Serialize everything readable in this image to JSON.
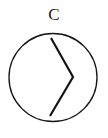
{
  "figure": {
    "label": "C",
    "label_x": 54,
    "label_baseline_y": 20,
    "label_font_size": 17,
    "background_color": "#ffffff",
    "stroke_color": "#171717",
    "label_color": "#1a1a1a",
    "canvas": {
      "width": 108,
      "height": 138
    }
  },
  "circle": {
    "name": "outline-circle",
    "cx": 53,
    "cy": 77.5,
    "r": 44,
    "stroke_width": 1.35,
    "fill": "none",
    "stroke_color": "#171717"
  },
  "chevron": {
    "name": "chevron-right-glyph",
    "points": "51,38 73,77 50,116",
    "vertices": [
      {
        "x": 51,
        "y": 38
      },
      {
        "x": 73,
        "y": 77
      },
      {
        "x": 50,
        "y": 116
      }
    ],
    "stroke_width": 2.2,
    "fill": "none",
    "stroke_color": "#151515"
  }
}
